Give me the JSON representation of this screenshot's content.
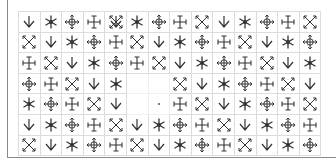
{
  "grid": {
    "rows": 7,
    "cols": 14,
    "cells": [
      [
        "down",
        "star",
        "move",
        "cross",
        "expand+down",
        "star",
        "move",
        "cross",
        "expand",
        "down",
        "star",
        "move",
        "cross",
        "expand"
      ],
      [
        "expand",
        "down",
        "star",
        "move",
        "cross",
        "expand",
        "down",
        "star",
        "move",
        "cross",
        "expand",
        "down",
        "star",
        "move"
      ],
      [
        "cross",
        "expand",
        "down",
        "star",
        "move",
        "cross",
        "expand",
        "down",
        "star",
        "move",
        "cross",
        "expand",
        "down",
        "star"
      ],
      [
        "move",
        "cross",
        "expand",
        "down",
        "star",
        "blank",
        "blank",
        "expand",
        "down",
        "star",
        "move",
        "cross",
        "expand",
        "down"
      ],
      [
        "star",
        "move",
        "cross",
        "expand",
        "down",
        "blank",
        "dot",
        "cross",
        "expand",
        "down",
        "star",
        "move",
        "cross",
        "expand"
      ],
      [
        "down",
        "star",
        "move",
        "cross",
        "expand",
        "down",
        "star",
        "move",
        "cross",
        "expand",
        "down",
        "star",
        "move",
        "cross"
      ],
      [
        "expand",
        "down",
        "star",
        "move",
        "cross",
        "expand",
        "down",
        "star",
        "move",
        "cross",
        "expand",
        "down",
        "star",
        "move"
      ]
    ]
  },
  "icons": {
    "down": "down-arrow-icon",
    "star": "asterisk-icon",
    "move": "move-arrows-icon",
    "cross": "ibeam-cross-icon",
    "expand": "diagonal-expand-icon"
  },
  "colors": {
    "glyph": "#333333",
    "gridline": "#dcdcdc",
    "frame": "#8a8a8a"
  }
}
